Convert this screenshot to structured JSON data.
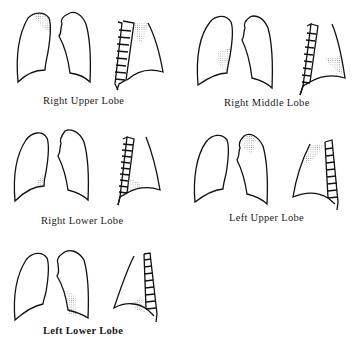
{
  "figure": {
    "panels": [
      {
        "id": "right-upper-lobe",
        "label": "Right Upper Lobe",
        "shaded_region": "right lung apex (frontal) / upper anterior (lateral)"
      },
      {
        "id": "right-middle-lobe",
        "label": "Right Middle Lobe",
        "shaded_region": "right lung lower medial border (frontal) / anterior lower (lateral)"
      },
      {
        "id": "right-lower-lobe",
        "label": "Right Lower Lobe",
        "shaded_region": "right lung base medial (frontal) / posterior base (lateral)"
      },
      {
        "id": "left-upper-lobe",
        "label": "Left Upper Lobe",
        "shaded_region": "left lung apex (frontal) / upper anterior (lateral)"
      },
      {
        "id": "left-lower-lobe",
        "label": "Left Lower Lobe",
        "shaded_region": "left lung lower medial (frontal) / posterior base (lateral)"
      }
    ],
    "colors": {
      "line": "#111111",
      "shading": "#9a9a9a",
      "background": "#ffffff"
    }
  }
}
